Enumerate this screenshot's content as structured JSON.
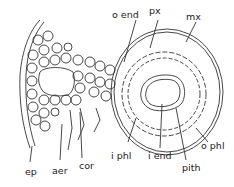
{
  "diagram": {
    "type": "plant stem cross-section (anatomical line drawing)",
    "labels": [
      {
        "id": "o_end",
        "text": "o end"
      },
      {
        "id": "px",
        "text": "px"
      },
      {
        "id": "mx",
        "text": "mx"
      },
      {
        "id": "o_phl",
        "text": "o phl"
      },
      {
        "id": "pith",
        "text": "pith"
      },
      {
        "id": "i_end",
        "text": "i end"
      },
      {
        "id": "i_phl",
        "text": "i phl"
      },
      {
        "id": "cor",
        "text": "cor"
      },
      {
        "id": "aer",
        "text": "aer"
      },
      {
        "id": "ep",
        "text": "ep"
      }
    ]
  }
}
